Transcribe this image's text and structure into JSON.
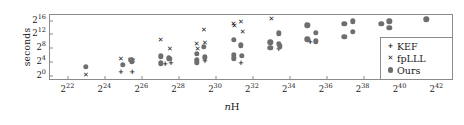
{
  "chart_data": {
    "type": "scatter",
    "title": "",
    "xlabel": "nH",
    "xlabel_parts": {
      "italic": "n",
      "roman": "H"
    },
    "ylabel": "seconds",
    "xscale": "log2",
    "yscale": "log2",
    "xlim": [
      21.0,
      42.9
    ],
    "ylim": [
      -1.6,
      17.6
    ],
    "grid": false,
    "legend_position": "lower-right",
    "xtick_labels": [
      "2^22",
      "2^24",
      "2^26",
      "2^28",
      "2^30",
      "2^32",
      "2^34",
      "2^36",
      "2^38",
      "2^40",
      "2^42"
    ],
    "xtick_bases": [
      "2",
      "2",
      "2",
      "2",
      "2",
      "2",
      "2",
      "2",
      "2",
      "2",
      "2"
    ],
    "xtick_exponents": [
      "22",
      "24",
      "26",
      "28",
      "30",
      "32",
      "34",
      "36",
      "38",
      "40",
      "42"
    ],
    "xtick_values": [
      22,
      24,
      26,
      28,
      30,
      32,
      34,
      36,
      38,
      40,
      42
    ],
    "ytick_labels": [
      "2^0",
      "2^4",
      "2^8",
      "2^12",
      "2^16"
    ],
    "ytick_bases": [
      "2",
      "2",
      "2",
      "2",
      "2"
    ],
    "ytick_exponents": [
      "0",
      "4",
      "8",
      "12",
      "16"
    ],
    "ytick_values": [
      0,
      4,
      8,
      12,
      16
    ],
    "series": [
      {
        "name": "KEF",
        "marker": "plus",
        "glyph": "+",
        "color": "#1a1a1a",
        "points": [
          [
            24.85,
            1.1
          ],
          [
            25.45,
            1.1
          ],
          [
            27.25,
            3.3
          ],
          [
            27.55,
            3.5
          ],
          [
            29.4,
            4.2
          ],
          [
            31.35,
            3.6
          ],
          [
            33.4,
            7.7
          ],
          [
            35.1,
            9.8
          ]
        ]
      },
      {
        "name": "fpLLL",
        "marker": "cross",
        "glyph": "✕",
        "color": "#1a1a1a",
        "points": [
          [
            22.95,
            0.2
          ],
          [
            24.85,
            4.8
          ],
          [
            25.35,
            4.6
          ],
          [
            25.5,
            4.3
          ],
          [
            27.0,
            10.2
          ],
          [
            27.5,
            7.6
          ],
          [
            28.95,
            9.3
          ],
          [
            29.0,
            7.6
          ],
          [
            29.35,
            13.3
          ],
          [
            29.4,
            9.6
          ],
          [
            30.95,
            15.1
          ],
          [
            31.0,
            14.3
          ],
          [
            31.35,
            15.7
          ],
          [
            31.45,
            12.6
          ],
          [
            33.0,
            16.5
          ]
        ]
      },
      {
        "name": "Ours",
        "marker": "circle",
        "glyph": "●",
        "color": "#6e6e6e",
        "points": [
          [
            22.95,
            2.5
          ],
          [
            24.95,
            3.2
          ],
          [
            25.4,
            4.6
          ],
          [
            25.45,
            3.9
          ],
          [
            27.0,
            5.6
          ],
          [
            27.0,
            3.6
          ],
          [
            27.45,
            5.0
          ],
          [
            27.5,
            4.9
          ],
          [
            28.95,
            6.4
          ],
          [
            28.95,
            4.6
          ],
          [
            28.95,
            3.8
          ],
          [
            29.35,
            8.4
          ],
          [
            29.4,
            5.3
          ],
          [
            30.95,
            10.4
          ],
          [
            30.95,
            6.0
          ],
          [
            30.95,
            5.0
          ],
          [
            31.35,
            8.8
          ],
          [
            31.4,
            5.8
          ],
          [
            32.95,
            9.7
          ],
          [
            32.95,
            8.1
          ],
          [
            33.4,
            12.3
          ],
          [
            33.4,
            9.2
          ],
          [
            33.45,
            8.5
          ],
          [
            34.95,
            14.6
          ],
          [
            34.95,
            10.5
          ],
          [
            35.4,
            12.4
          ],
          [
            35.4,
            10.0
          ],
          [
            36.95,
            15.0
          ],
          [
            36.95,
            11.3
          ],
          [
            37.4,
            15.8
          ],
          [
            37.4,
            12.7
          ],
          [
            38.95,
            15.0
          ],
          [
            39.4,
            15.8
          ],
          [
            39.4,
            13.9
          ],
          [
            41.4,
            16.3
          ]
        ]
      }
    ],
    "legend": [
      {
        "label": "KEF",
        "marker": "plus",
        "glyph": "+"
      },
      {
        "label": "fpLLL",
        "marker": "cross",
        "glyph": "✕"
      },
      {
        "label": "Ours",
        "marker": "circle",
        "glyph": "●"
      }
    ]
  },
  "colors": {
    "ours_marker": "#6e6e6e",
    "ink": "#1a1a1a",
    "frame": "#8a8a8a",
    "background": "#ffffff"
  }
}
